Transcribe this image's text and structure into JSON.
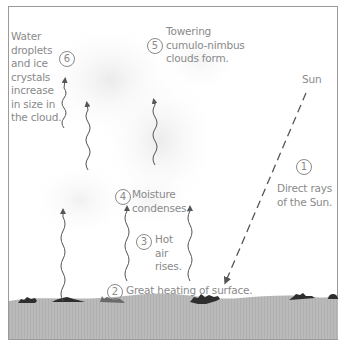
{
  "diagram": {
    "colors": {
      "text": "#8a8a8a",
      "arrow": "#555555",
      "ground": "#b9b9b9",
      "border": "#9a9a9a",
      "vegetation": "#2e2e2e"
    },
    "sun_label": "Sun",
    "steps": [
      {
        "number": "1",
        "text_lines": [
          "Direct rays",
          "of the Sun."
        ]
      },
      {
        "number": "2",
        "text_lines": [
          "Great heating of surface."
        ]
      },
      {
        "number": "3",
        "text_lines": [
          "Hot",
          "air",
          "rises."
        ]
      },
      {
        "number": "4",
        "text_lines": [
          "Moisture",
          "condenses."
        ]
      },
      {
        "number": "5",
        "text_lines": [
          "Towering",
          "cumulo-nimbus",
          "clouds form."
        ]
      },
      {
        "number": "6",
        "text_lines": [
          "Water",
          "droplets",
          "and ice",
          "crystals",
          "increase",
          "in size in",
          "the cloud."
        ]
      }
    ]
  }
}
